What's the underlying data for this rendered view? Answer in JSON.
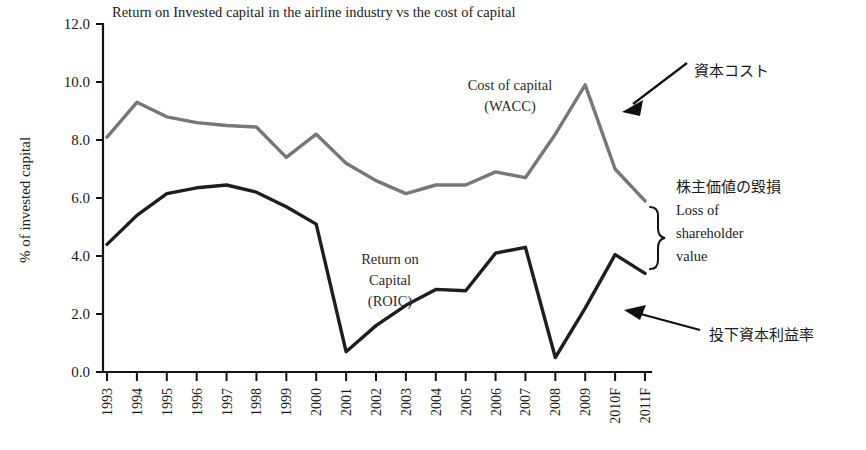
{
  "chart_data": {
    "type": "line",
    "title": "Return on Invested capital in the airline industry vs the cost of capital",
    "xlabel": "",
    "ylabel": "% of invested capital",
    "ylim": [
      0.0,
      12.0
    ],
    "ytick_values": [
      0.0,
      2.0,
      4.0,
      6.0,
      8.0,
      10.0,
      12.0
    ],
    "ytick_labels": [
      "0.0",
      "2.0",
      "4.0",
      "6.0",
      "8.0",
      "10.0",
      "12.0"
    ],
    "grid": false,
    "legend_position": "inline-annotations",
    "categories": [
      "1993",
      "1994",
      "1995",
      "1996",
      "1997",
      "1998",
      "1999",
      "2000",
      "2001",
      "2002",
      "2003",
      "2004",
      "2005",
      "2006",
      "2007",
      "2008",
      "2009",
      "2010F",
      "2011F"
    ],
    "series": [
      {
        "name": "Cost of capital (WACC)",
        "color": "#777777",
        "values": [
          8.1,
          9.3,
          8.8,
          8.6,
          8.5,
          8.45,
          7.4,
          8.2,
          7.2,
          6.6,
          6.15,
          6.45,
          6.45,
          6.9,
          6.7,
          8.2,
          9.9,
          7.0,
          5.9
        ]
      },
      {
        "name": "Return on Capital (ROIC)",
        "color": "#1e1e1e",
        "values": [
          4.4,
          5.4,
          6.15,
          6.35,
          6.45,
          6.2,
          5.7,
          5.1,
          0.7,
          1.6,
          2.3,
          2.85,
          2.8,
          4.1,
          4.3,
          0.5,
          2.2,
          4.05,
          3.4
        ]
      }
    ],
    "inline_labels": [
      {
        "name": "wacc-label",
        "lines": [
          "Cost of capital",
          "(WACC)"
        ]
      },
      {
        "name": "roic-label",
        "lines": [
          "Return on",
          "Capital",
          "(ROIC)"
        ]
      }
    ]
  },
  "annotations": {
    "cost_of_capital_jp": "資本コスト",
    "shareholder_loss_jp": "株主価値の毀損",
    "shareholder_loss_en_line1": "Loss of",
    "shareholder_loss_en_line2": "shareholder",
    "shareholder_loss_en_line3": "value",
    "roic_jp": "投下資本利益率"
  }
}
